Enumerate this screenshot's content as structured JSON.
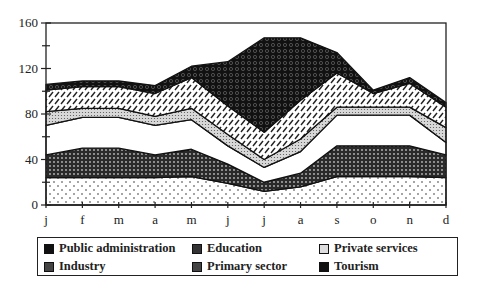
{
  "chart_data": {
    "type": "area",
    "stacked": true,
    "title": "",
    "xlabel": "",
    "ylabel": "",
    "ylim": [
      0,
      160
    ],
    "yticks": [
      0,
      40,
      80,
      120,
      160
    ],
    "yminor_ticks": [
      20,
      60,
      100,
      140
    ],
    "grid": false,
    "legend_position": "bottom",
    "categories": [
      "j",
      "f",
      "m",
      "a",
      "m",
      "j",
      "j",
      "a",
      "s",
      "o",
      "n",
      "d"
    ],
    "series": [
      {
        "name": "Primary sector",
        "pattern": "sparse-dots",
        "values": [
          24,
          24,
          24,
          24,
          25,
          19,
          12,
          16,
          25,
          25,
          25,
          24
        ]
      },
      {
        "name": "Industry",
        "pattern": "dense-check",
        "values": [
          20,
          26,
          26,
          20,
          24,
          17,
          8,
          12,
          27,
          27,
          27,
          20
        ]
      },
      {
        "name": "Private services",
        "pattern": "white",
        "values": [
          26,
          27,
          27,
          26,
          26,
          16,
          13,
          19,
          27,
          27,
          27,
          11
        ]
      },
      {
        "name": "Public administration",
        "pattern": "fine-dots",
        "values": [
          12,
          8,
          8,
          8,
          10,
          10,
          7,
          11,
          7,
          7,
          7,
          13
        ]
      },
      {
        "name": "Education",
        "pattern": "hatched",
        "values": [
          19,
          19,
          19,
          20,
          27,
          25,
          24,
          34,
          30,
          12,
          21,
          18
        ]
      },
      {
        "name": "Tourism",
        "pattern": "dark",
        "values": [
          5,
          5,
          5,
          7,
          10,
          39,
          83,
          55,
          18,
          3,
          5,
          4
        ]
      }
    ],
    "cumulative_tops": {
      "Primary sector": [
        24,
        24,
        24,
        24,
        25,
        19,
        12,
        16,
        25,
        25,
        25,
        24
      ],
      "Industry": [
        44,
        50,
        50,
        44,
        49,
        36,
        20,
        28,
        52,
        52,
        52,
        44
      ],
      "Private services": [
        70,
        77,
        77,
        70,
        75,
        52,
        33,
        47,
        79,
        79,
        79,
        55
      ],
      "Public administration": [
        82,
        85,
        85,
        78,
        85,
        62,
        40,
        58,
        86,
        86,
        86,
        68
      ],
      "Education": [
        101,
        104,
        104,
        98,
        112,
        87,
        64,
        92,
        116,
        98,
        107,
        86
      ],
      "Tourism": [
        106,
        109,
        109,
        105,
        122,
        126,
        147,
        147,
        134,
        101,
        112,
        90
      ]
    }
  },
  "legend": {
    "items": [
      {
        "label": "Public administration",
        "swatch": "dark-square"
      },
      {
        "label": "Education",
        "swatch": "dark-pattern-square"
      },
      {
        "label": "Private services",
        "swatch": "light-square"
      },
      {
        "label": "Industry",
        "swatch": "dark-pattern-square"
      },
      {
        "label": "Primary sector",
        "swatch": "dark-pattern-square"
      },
      {
        "label": "Tourism",
        "swatch": "dark-square"
      }
    ]
  }
}
